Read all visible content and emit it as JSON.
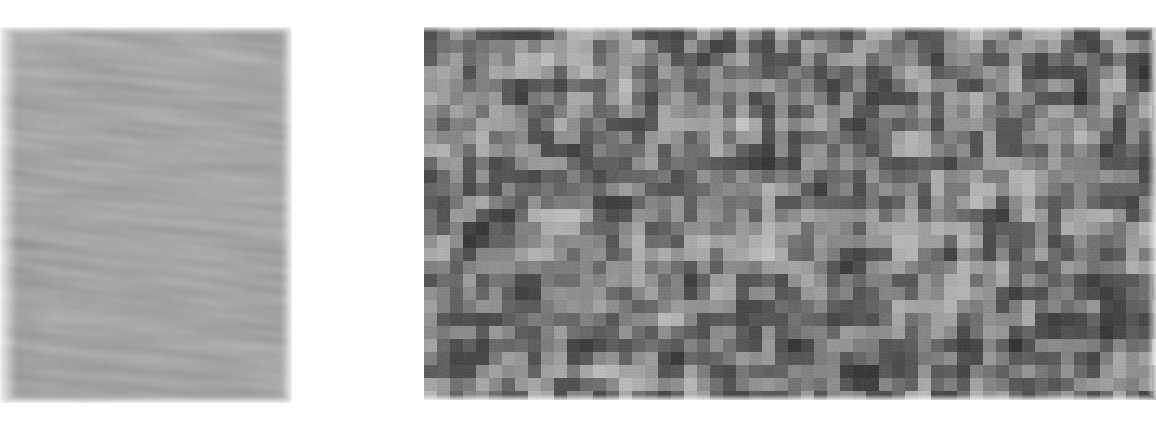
{
  "figure": {
    "background_color": "#ffffff",
    "width": 1156,
    "height": 428,
    "caption": "",
    "title": ""
  },
  "panels": [
    {
      "id": "left-panel",
      "name": "smooth-streaked-grayscale-image",
      "label": "",
      "x": 0,
      "y": 27,
      "width": 292,
      "height": 376,
      "render_type": "smooth-streak-noise",
      "description": "Smooth grayscale texture with horizontally elongated streaks slanting slightly downward to the right, overlaid with fine vertical scan-line texture.",
      "mean_gray": "#a8a8a8",
      "min_gray": "#6e6e6e",
      "max_gray": "#e8e8e8",
      "streak_angle_deg": -6,
      "streak_length_px": 46,
      "streak_height_px": 7,
      "scanline_period_px": 2,
      "scanline_amplitude": 11,
      "blur_px": 2.2,
      "seed": 10247
    },
    {
      "id": "right-panel",
      "name": "blocky-pixelated-noise-image",
      "label": "",
      "x": 424,
      "y": 27,
      "width": 732,
      "height": 373,
      "render_type": "block-noise",
      "description": "Coarse pixelated grayscale noise composed of square blocks of roughly 13 pixels, darker overall and higher contrast than the left panel.",
      "mean_gray": "#7a7a7a",
      "min_gray": "#2c2c2c",
      "max_gray": "#e0e0e0",
      "block_size_px": 13,
      "columns": 57,
      "rows": 29,
      "contrast": 0.62,
      "grain_amplitude": 9,
      "seed": 88231
    }
  ],
  "gap": {
    "name": "white-separator",
    "x": 292,
    "y": 0,
    "width": 132,
    "height": 428,
    "color": "#ffffff"
  },
  "chart_data": {
    "type": "heatmap",
    "title": "",
    "xlabel": "",
    "ylabel": "",
    "legend": [],
    "colormap": "gray",
    "panels": [
      {
        "name": "left",
        "kind": "smooth-streak-noise",
        "grid": [
          376,
          292
        ],
        "value_range": [
          0.36,
          0.91
        ],
        "mean": 0.66
      },
      {
        "name": "right",
        "kind": "block-noise",
        "grid": [
          29,
          57
        ],
        "block_px": 13,
        "value_range": [
          0.17,
          0.88
        ],
        "mean": 0.48
      }
    ]
  }
}
